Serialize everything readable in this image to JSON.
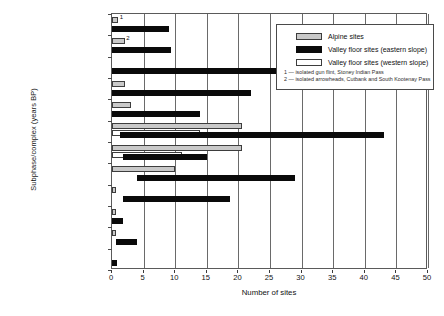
{
  "chart_data": {
    "type": "bar",
    "title": "",
    "xlabel": "Number of sites",
    "ylabel": "Subphase/complex (years BP)",
    "xlim": [
      0,
      50
    ],
    "xticks": [
      0,
      5,
      10,
      15,
      20,
      25,
      30,
      35,
      40,
      45,
      50
    ],
    "xtick_labels": [
      "0",
      "5",
      "10",
      "15",
      "20",
      "25",
      "30",
      "35",
      "40",
      "45",
      "50"
    ],
    "grid": true,
    "orientation": "horizontal",
    "legend_position": "top-right",
    "categories": [
      "Contact",
      "Tobacco Plains",
      "Pass Creek Valley",
      "Crandell Mountain",
      "Waterton River",
      "Blue Slate Canyon",
      "Many Glacier",
      "Bellevue Hill",
      "Red Rock Canyon",
      "Cody",
      "Lake Linnet",
      "Clovis"
    ],
    "date_ticks": [
      "100",
      "300",
      "800 / 300",
      "800",
      "1,300 / 1,500",
      "2,000 / 1,600",
      "3,000",
      "4,000",
      "7,750",
      "9,000",
      "9,500",
      "10,000",
      "10,500"
    ],
    "series": [
      {
        "name": "Alpine sites",
        "color": "#c9c9c9",
        "values": [
          1,
          2,
          0,
          2,
          3,
          20.5,
          20.5,
          10,
          0.7,
          0.7,
          0.7,
          0
        ]
      },
      {
        "name": "Valley floor sites (eastern slope)",
        "color": "#0a0a0a",
        "values": [
          9,
          9.3,
          28.5,
          22,
          14,
          43,
          15,
          29,
          18.6,
          1.8,
          4,
          0.8
        ],
        "starts": [
          0,
          0,
          0,
          0,
          0,
          1.2,
          1.7,
          4,
          1.7,
          0,
          0.6,
          0
        ]
      },
      {
        "name": "Valley floor sites (western slope)",
        "color": "#ffffff",
        "values": [
          0,
          0,
          0,
          0,
          0,
          14,
          11,
          0,
          0,
          0,
          0,
          0
        ]
      }
    ],
    "bar_notes": [
      {
        "label": "1",
        "category": "Contact"
      },
      {
        "label": "2",
        "category": "Tobacco Plains"
      }
    ],
    "footnotes": [
      "1 — isolated gun flint, Stoney Indian Pass",
      "2 — isolated arrowheads, Cutbank and South Kootenay Pass"
    ]
  }
}
